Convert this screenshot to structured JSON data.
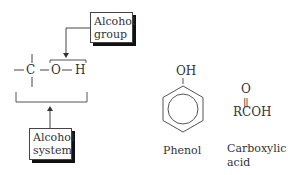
{
  "alcohol_panel": {
    "group_callout": {
      "line1": "Alcohol",
      "line2": "group"
    },
    "system_callout": {
      "line1": "Alcohol",
      "line2": "system"
    },
    "formula": {
      "c": "C",
      "o": "O",
      "h": "H"
    }
  },
  "phenol": {
    "substituent": "OH",
    "label": "Phenol"
  },
  "carboxylic_acid": {
    "carbonyl_o": "O",
    "double_bond": "||",
    "formula": "RCOH",
    "label_line1": "Carboxylic",
    "label_line2": "acid"
  },
  "colors": {
    "ink": "#333333",
    "shadow": "#111111",
    "background": "#ffffff"
  }
}
